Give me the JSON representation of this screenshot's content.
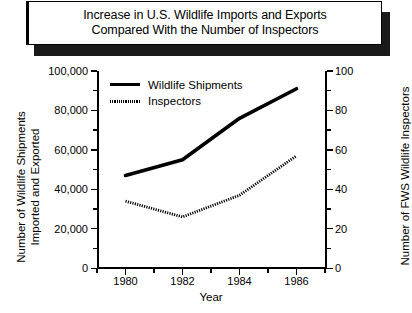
{
  "title": {
    "line1": "Increase in U.S. Wildlife Imports and Exports",
    "line2": "Compared With the Number of Inspectors"
  },
  "chart_data": {
    "type": "line",
    "title": "Increase in U.S. Wildlife Imports and Exports Compared With the Number of Inspectors",
    "xlabel": "Year",
    "ylabel": "Number of Wildlife Shipments Imported and Exported",
    "ylabel_right": "Number of FWS Wildlife Inspectors",
    "x": [
      1980,
      1982,
      1984,
      1986
    ],
    "xlim": [
      1979,
      1987
    ],
    "ylim": [
      0,
      100000
    ],
    "ylim_right": [
      0,
      100
    ],
    "grid": false,
    "legend_position": "top-left",
    "series": [
      {
        "name": "Wildlife Shipments",
        "axis": "left",
        "style": "solid",
        "color": "#000000",
        "values": [
          47000,
          55000,
          76000,
          91000
        ]
      },
      {
        "name": "Inspectors",
        "axis": "right",
        "style": "dotted",
        "color": "#000000",
        "values": [
          34,
          26,
          37,
          57
        ]
      }
    ],
    "xticks": [
      1980,
      1982,
      1984,
      1986
    ],
    "xticklabels": [
      "1980",
      "1982",
      "1984",
      "1986"
    ],
    "xticks_minor": [
      1979,
      1981,
      1983,
      1985,
      1987
    ],
    "yticks_left": [
      0,
      20000,
      40000,
      60000,
      80000,
      100000
    ],
    "yticklabels_left": [
      "0",
      "20,000",
      "40,000",
      "60,000",
      "80,000",
      "100,000"
    ],
    "yticks_left_minor": [
      10000,
      30000,
      50000,
      70000,
      90000
    ],
    "yticks_right": [
      0,
      20,
      40,
      60,
      80,
      100
    ],
    "yticklabels_right": [
      "0",
      "20",
      "40",
      "60",
      "80",
      "100"
    ],
    "yticks_right_minor": [
      10,
      30,
      50,
      70,
      90
    ]
  },
  "axes": {
    "left_title_line1": "Number of Wildlife Shipments",
    "left_title_line2": "Imported and Exported",
    "right_title": "Number of FWS Wildlife Inspectors",
    "x_title": "Year"
  },
  "legend": {
    "items": [
      {
        "label": "Wildlife Shipments",
        "style": "solid"
      },
      {
        "label": "Inspectors",
        "style": "dotted"
      }
    ]
  }
}
